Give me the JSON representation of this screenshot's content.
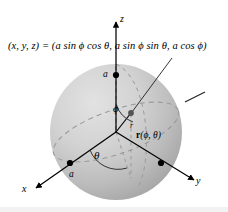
{
  "figure": {
    "background_color": "#ffffff",
    "sphere": {
      "fill_light": "#d8d8d8",
      "fill_dark": "#a8a8a8",
      "center_x": 116,
      "center_y": 132,
      "radius_x": 66,
      "radius_y": 68
    },
    "equation": {
      "lhs": "(x, y, z) = (",
      "term1": "a sin ϕ cos θ",
      "sep1": ", ",
      "term2": "a sin ϕ sin θ",
      "sep2": ", ",
      "term3": "a cos ϕ",
      "rhs": ")",
      "full": "(x, y, z) = (a sin ϕ cos θ, a sin ϕ sin θ, a cos ϕ)"
    },
    "axes": [
      {
        "name": "z-axis",
        "label": "z",
        "direction": "up"
      },
      {
        "name": "x-axis",
        "label": "x",
        "direction": "lower-left"
      },
      {
        "name": "y-axis",
        "label": "y",
        "direction": "lower-right"
      }
    ],
    "markers": [
      {
        "name": "radius-on-z",
        "label": "a",
        "axis": "z"
      },
      {
        "name": "radius-on-x",
        "label": "a",
        "axis": "x"
      },
      {
        "name": "point-on-sphere",
        "label": ""
      }
    ],
    "angles": [
      {
        "name": "polar-angle",
        "label": "ϕ"
      },
      {
        "name": "azimuthal-angle",
        "label": "θ"
      }
    ],
    "vector": {
      "label_bold": "r",
      "label_args": "(ϕ, θ)",
      "full": "r(ϕ, θ)",
      "magnitude_label": "r"
    },
    "colors": {
      "stroke": "#000000",
      "dashed_gray": "#9a9a9a",
      "sphere_light": "#dcdcdc",
      "sphere_shadow": "#9f9f9f"
    }
  }
}
